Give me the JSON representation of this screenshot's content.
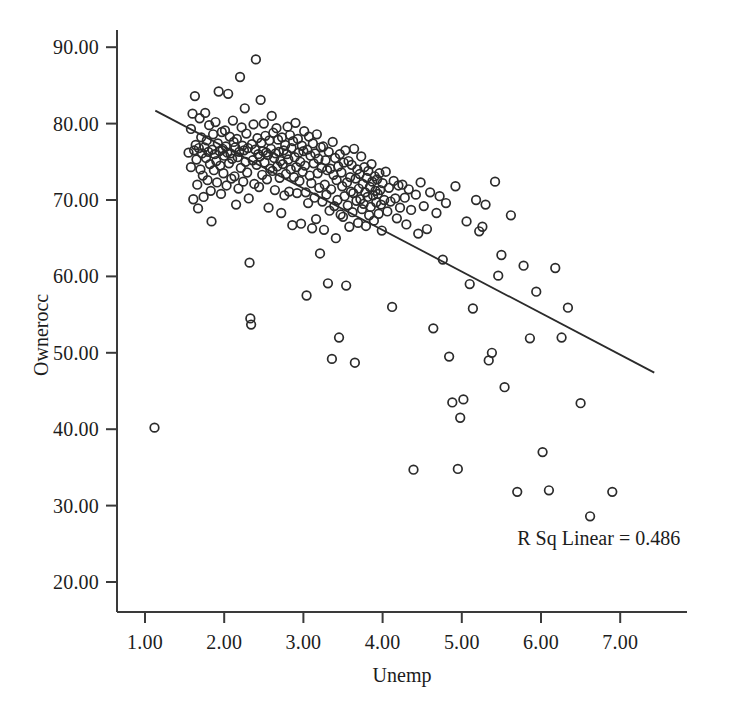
{
  "chart_data": {
    "type": "scatter",
    "title": "",
    "xlabel": "Unemp",
    "ylabel": "Ownerocc",
    "xlim": [
      0.62,
      7.22
    ],
    "ylim": [
      16.2,
      92.7
    ],
    "xticks": [
      "1.00",
      "2.00",
      "3.00",
      "4.00",
      "5.00",
      "6.00",
      "7.00"
    ],
    "xtick_values": [
      1.0,
      2.0,
      3.0,
      4.0,
      5.0,
      6.0,
      7.0
    ],
    "yticks": [
      "20.00",
      "30.00",
      "40.00",
      "50.00",
      "60.00",
      "70.00",
      "80.00",
      "90.00"
    ],
    "ytick_values": [
      20.0,
      30.0,
      40.0,
      50.0,
      60.0,
      70.0,
      80.0,
      90.0
    ],
    "grid": false,
    "legend": null,
    "marker": "open-circle",
    "marker_color": "#2b2b2b",
    "annotations": [
      {
        "text": "R Sq Linear = 0.486",
        "x": 5.7,
        "y": 27.2
      }
    ],
    "fit_line": {
      "type": "linear",
      "r_squared": 0.486,
      "color": "#2b2b2b",
      "x_start": 1.13,
      "y_start": 81.7,
      "x_end": 7.43,
      "y_end": 47.4
    },
    "points": [
      [
        1.12,
        40.2
      ],
      [
        1.55,
        76.2
      ],
      [
        1.58,
        74.3
      ],
      [
        1.58,
        79.3
      ],
      [
        1.6,
        81.3
      ],
      [
        1.61,
        70.1
      ],
      [
        1.62,
        76.5
      ],
      [
        1.63,
        83.6
      ],
      [
        1.64,
        77.2
      ],
      [
        1.65,
        75.3
      ],
      [
        1.66,
        72.0
      ],
      [
        1.67,
        68.9
      ],
      [
        1.68,
        76.8
      ],
      [
        1.69,
        80.7
      ],
      [
        1.7,
        74.0
      ],
      [
        1.71,
        78.2
      ],
      [
        1.72,
        76.1
      ],
      [
        1.73,
        73.2
      ],
      [
        1.74,
        70.4
      ],
      [
        1.75,
        76.9
      ],
      [
        1.76,
        81.4
      ],
      [
        1.77,
        75.5
      ],
      [
        1.78,
        77.8
      ],
      [
        1.79,
        72.6
      ],
      [
        1.8,
        76.3
      ],
      [
        1.81,
        79.8
      ],
      [
        1.82,
        74.7
      ],
      [
        1.83,
        71.2
      ],
      [
        1.84,
        67.2
      ],
      [
        1.85,
        76.6
      ],
      [
        1.86,
        78.6
      ],
      [
        1.87,
        73.9
      ],
      [
        1.88,
        76.0
      ],
      [
        1.89,
        80.2
      ],
      [
        1.9,
        75.1
      ],
      [
        1.91,
        72.3
      ],
      [
        1.92,
        77.4
      ],
      [
        1.93,
        84.2
      ],
      [
        1.94,
        76.4
      ],
      [
        1.95,
        74.5
      ],
      [
        1.96,
        70.8
      ],
      [
        1.97,
        78.9
      ],
      [
        1.98,
        76.7
      ],
      [
        1.99,
        73.5
      ],
      [
        2.0,
        75.8
      ],
      [
        2.01,
        79.1
      ],
      [
        2.02,
        77.0
      ],
      [
        2.03,
        71.9
      ],
      [
        2.04,
        76.2
      ],
      [
        2.05,
        83.9
      ],
      [
        2.06,
        74.8
      ],
      [
        2.07,
        78.3
      ],
      [
        2.08,
        76.1
      ],
      [
        2.09,
        72.8
      ],
      [
        2.1,
        75.4
      ],
      [
        2.11,
        80.4
      ],
      [
        2.12,
        77.6
      ],
      [
        2.13,
        73.1
      ],
      [
        2.14,
        76.9
      ],
      [
        2.15,
        69.4
      ],
      [
        2.16,
        78.0
      ],
      [
        2.17,
        75.6
      ],
      [
        2.18,
        71.5
      ],
      [
        2.19,
        76.3
      ],
      [
        2.2,
        86.1
      ],
      [
        2.21,
        74.2
      ],
      [
        2.22,
        79.5
      ],
      [
        2.23,
        77.1
      ],
      [
        2.24,
        72.4
      ],
      [
        2.25,
        76.5
      ],
      [
        2.26,
        82.0
      ],
      [
        2.27,
        75.0
      ],
      [
        2.28,
        78.7
      ],
      [
        2.29,
        73.6
      ],
      [
        2.3,
        76.8
      ],
      [
        2.31,
        70.2
      ],
      [
        2.32,
        61.8
      ],
      [
        2.33,
        54.5
      ],
      [
        2.34,
        53.7
      ],
      [
        2.35,
        77.3
      ],
      [
        2.36,
        75.2
      ],
      [
        2.37,
        79.9
      ],
      [
        2.38,
        72.1
      ],
      [
        2.39,
        76.6
      ],
      [
        2.4,
        88.4
      ],
      [
        2.41,
        74.6
      ],
      [
        2.42,
        78.1
      ],
      [
        2.43,
        76.0
      ],
      [
        2.44,
        71.7
      ],
      [
        2.45,
        75.7
      ],
      [
        2.46,
        83.1
      ],
      [
        2.47,
        77.5
      ],
      [
        2.48,
        73.3
      ],
      [
        2.49,
        76.4
      ],
      [
        2.5,
        80.0
      ],
      [
        2.51,
        74.9
      ],
      [
        2.52,
        78.4
      ],
      [
        2.53,
        76.2
      ],
      [
        2.54,
        72.7
      ],
      [
        2.55,
        75.9
      ],
      [
        2.56,
        69.0
      ],
      [
        2.57,
        77.8
      ],
      [
        2.58,
        74.1
      ],
      [
        2.59,
        76.7
      ],
      [
        2.6,
        81.0
      ],
      [
        2.61,
        73.8
      ],
      [
        2.62,
        78.8
      ],
      [
        2.63,
        75.5
      ],
      [
        2.64,
        71.3
      ],
      [
        2.65,
        76.1
      ],
      [
        2.66,
        79.4
      ],
      [
        2.67,
        74.4
      ],
      [
        2.68,
        77.9
      ],
      [
        2.69,
        76.3
      ],
      [
        2.7,
        72.9
      ],
      [
        2.71,
        75.1
      ],
      [
        2.72,
        68.3
      ],
      [
        2.73,
        78.2
      ],
      [
        2.74,
        74.7
      ],
      [
        2.75,
        76.5
      ],
      [
        2.76,
        70.6
      ],
      [
        2.77,
        77.2
      ],
      [
        2.78,
        73.4
      ],
      [
        2.79,
        76.0
      ],
      [
        2.8,
        79.6
      ],
      [
        2.81,
        75.3
      ],
      [
        2.82,
        71.1
      ],
      [
        2.83,
        78.5
      ],
      [
        2.84,
        74.0
      ],
      [
        2.85,
        76.8
      ],
      [
        2.86,
        66.7
      ],
      [
        2.87,
        77.7
      ],
      [
        2.88,
        73.0
      ],
      [
        2.89,
        75.6
      ],
      [
        2.9,
        80.1
      ],
      [
        2.91,
        74.3
      ],
      [
        2.92,
        70.9
      ],
      [
        2.93,
        78.0
      ],
      [
        2.94,
        76.2
      ],
      [
        2.95,
        72.5
      ],
      [
        2.96,
        75.0
      ],
      [
        2.97,
        66.9
      ],
      [
        2.98,
        77.1
      ],
      [
        2.99,
        73.7
      ],
      [
        3.0,
        76.4
      ],
      [
        3.01,
        79.0
      ],
      [
        3.02,
        74.5
      ],
      [
        3.03,
        71.0
      ],
      [
        3.04,
        57.5
      ],
      [
        3.05,
        76.6
      ],
      [
        3.06,
        69.6
      ],
      [
        3.07,
        78.3
      ],
      [
        3.08,
        73.2
      ],
      [
        3.09,
        75.8
      ],
      [
        3.1,
        72.2
      ],
      [
        3.11,
        66.3
      ],
      [
        3.12,
        77.4
      ],
      [
        3.13,
        74.8
      ],
      [
        3.14,
        70.3
      ],
      [
        3.15,
        76.1
      ],
      [
        3.16,
        67.5
      ],
      [
        3.17,
        78.6
      ],
      [
        3.18,
        73.5
      ],
      [
        3.19,
        75.4
      ],
      [
        3.2,
        71.6
      ],
      [
        3.21,
        63.0
      ],
      [
        3.22,
        76.9
      ],
      [
        3.23,
        74.2
      ],
      [
        3.24,
        69.8
      ],
      [
        3.25,
        77.0
      ],
      [
        3.26,
        66.1
      ],
      [
        3.27,
        72.0
      ],
      [
        3.28,
        75.2
      ],
      [
        3.29,
        70.7
      ],
      [
        3.3,
        73.9
      ],
      [
        3.31,
        59.1
      ],
      [
        3.32,
        76.3
      ],
      [
        3.33,
        68.6
      ],
      [
        3.34,
        74.1
      ],
      [
        3.35,
        71.4
      ],
      [
        3.36,
        49.2
      ],
      [
        3.37,
        77.6
      ],
      [
        3.38,
        73.3
      ],
      [
        3.39,
        69.2
      ],
      [
        3.4,
        75.5
      ],
      [
        3.41,
        65.0
      ],
      [
        3.42,
        72.6
      ],
      [
        3.43,
        70.0
      ],
      [
        3.44,
        74.4
      ],
      [
        3.45,
        52.0
      ],
      [
        3.46,
        76.0
      ],
      [
        3.47,
        68.1
      ],
      [
        3.48,
        73.6
      ],
      [
        3.49,
        71.8
      ],
      [
        3.5,
        67.8
      ],
      [
        3.51,
        74.9
      ],
      [
        3.52,
        70.5
      ],
      [
        3.53,
        76.5
      ],
      [
        3.54,
        58.8
      ],
      [
        3.55,
        72.3
      ],
      [
        3.56,
        69.3
      ],
      [
        3.57,
        75.1
      ],
      [
        3.58,
        66.5
      ],
      [
        3.59,
        73.0
      ],
      [
        3.6,
        71.1
      ],
      [
        3.61,
        74.6
      ],
      [
        3.62,
        68.4
      ],
      [
        3.63,
        70.9
      ],
      [
        3.64,
        76.7
      ],
      [
        3.65,
        48.7
      ],
      [
        3.66,
        72.8
      ],
      [
        3.67,
        69.9
      ],
      [
        3.68,
        74.0
      ],
      [
        3.69,
        67.0
      ],
      [
        3.7,
        71.5
      ],
      [
        3.71,
        73.4
      ],
      [
        3.72,
        70.1
      ],
      [
        3.73,
        75.7
      ],
      [
        3.74,
        68.8
      ],
      [
        3.75,
        72.1
      ],
      [
        3.76,
        69.5
      ],
      [
        3.77,
        74.3
      ],
      [
        3.78,
        71.0
      ],
      [
        3.79,
        66.6
      ],
      [
        3.8,
        72.9
      ],
      [
        3.81,
        70.4
      ],
      [
        3.82,
        73.8
      ],
      [
        3.83,
        68.0
      ],
      [
        3.84,
        71.7
      ],
      [
        3.85,
        69.1
      ],
      [
        3.86,
        74.7
      ],
      [
        3.87,
        72.4
      ],
      [
        3.88,
        70.6
      ],
      [
        3.89,
        67.3
      ],
      [
        3.9,
        73.1
      ],
      [
        3.91,
        71.2
      ],
      [
        3.92,
        69.7
      ],
      [
        3.93,
        72.7
      ],
      [
        3.94,
        70.8
      ],
      [
        3.95,
        68.2
      ],
      [
        3.96,
        73.5
      ],
      [
        3.97,
        71.3
      ],
      [
        3.98,
        69.4
      ],
      [
        3.99,
        66.0
      ],
      [
        4.0,
        72.2
      ],
      [
        4.02,
        70.0
      ],
      [
        4.04,
        73.7
      ],
      [
        4.06,
        68.5
      ],
      [
        4.08,
        71.6
      ],
      [
        4.1,
        69.8
      ],
      [
        4.12,
        56.0
      ],
      [
        4.14,
        72.5
      ],
      [
        4.16,
        70.2
      ],
      [
        4.18,
        67.6
      ],
      [
        4.2,
        71.9
      ],
      [
        4.22,
        69.0
      ],
      [
        4.25,
        72.0
      ],
      [
        4.28,
        70.3
      ],
      [
        4.3,
        66.8
      ],
      [
        4.33,
        71.4
      ],
      [
        4.36,
        68.7
      ],
      [
        4.39,
        34.7
      ],
      [
        4.42,
        70.7
      ],
      [
        4.45,
        65.6
      ],
      [
        4.48,
        72.3
      ],
      [
        4.52,
        69.2
      ],
      [
        4.56,
        66.2
      ],
      [
        4.6,
        71.0
      ],
      [
        4.64,
        53.2
      ],
      [
        4.68,
        68.3
      ],
      [
        4.72,
        70.5
      ],
      [
        4.76,
        62.2
      ],
      [
        4.8,
        69.6
      ],
      [
        4.84,
        49.5
      ],
      [
        4.88,
        43.5
      ],
      [
        4.92,
        71.8
      ],
      [
        4.95,
        34.8
      ],
      [
        4.98,
        41.5
      ],
      [
        5.02,
        43.9
      ],
      [
        5.06,
        67.2
      ],
      [
        5.1,
        59.0
      ],
      [
        5.14,
        55.8
      ],
      [
        5.18,
        70.0
      ],
      [
        5.22,
        65.9
      ],
      [
        5.26,
        66.5
      ],
      [
        5.3,
        69.4
      ],
      [
        5.34,
        49.0
      ],
      [
        5.38,
        50.0
      ],
      [
        5.42,
        72.4
      ],
      [
        5.46,
        60.1
      ],
      [
        5.5,
        62.8
      ],
      [
        5.54,
        45.5
      ],
      [
        5.62,
        68.0
      ],
      [
        5.7,
        31.8
      ],
      [
        5.78,
        61.4
      ],
      [
        5.86,
        51.9
      ],
      [
        5.94,
        58.0
      ],
      [
        6.02,
        37.0
      ],
      [
        6.1,
        32.0
      ],
      [
        6.18,
        61.1
      ],
      [
        6.26,
        52.0
      ],
      [
        6.34,
        55.9
      ],
      [
        6.5,
        43.4
      ],
      [
        6.62,
        28.6
      ],
      [
        6.9,
        31.8
      ]
    ]
  },
  "axis": {
    "y_title": "Ownerocc",
    "x_title": "Unemp"
  }
}
